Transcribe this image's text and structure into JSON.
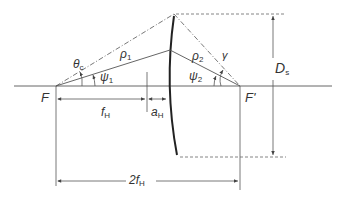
{
  "diagram": {
    "labels": {
      "focus_left": "F",
      "focus_right": "F'",
      "theta": "θ",
      "theta_sub": "c",
      "rho1": "ρ",
      "rho1_sub": "1",
      "rho2": "ρ",
      "rho2_sub": "2",
      "psi1": "ψ",
      "psi1_sub": "1",
      "psi2": "ψ",
      "psi2_sub": "2",
      "gamma": "γ",
      "diameter": "D",
      "diameter_sub": "s",
      "focal_length": "f",
      "focal_length_sub": "H",
      "offset": "a",
      "offset_sub": "H",
      "total_length": "2f",
      "total_length_sub": "H"
    },
    "colors": {
      "line": "#555555",
      "mirror": "#222222",
      "text": "#333333"
    }
  }
}
